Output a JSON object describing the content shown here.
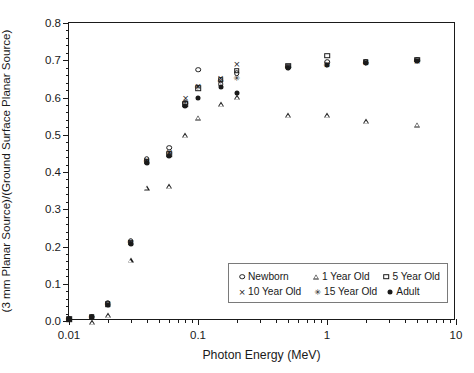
{
  "chart_data": {
    "type": "scatter",
    "title": "",
    "xlabel": "Photon Energy (MeV)",
    "ylabel": "(3 mm Planar Source)/(Ground Surface Planar Source)",
    "xscale": "log",
    "yscale": "linear",
    "xlim": [
      0.01,
      10
    ],
    "ylim": [
      0.0,
      0.8
    ],
    "ytick_labels": [
      "0.0",
      "0.1",
      "0.2",
      "0.3",
      "0.4",
      "0.5",
      "0.6",
      "0.7",
      "0.8"
    ],
    "ytick_values": [
      0.0,
      0.1,
      0.2,
      0.3,
      0.4,
      0.5,
      0.6,
      0.7,
      0.8
    ],
    "ytick_minor_step": 0.02,
    "xtick_labels": [
      "0.01",
      "0.1",
      "1",
      "10"
    ],
    "xtick_values": [
      0.01,
      0.1,
      1,
      10
    ],
    "grid": false,
    "legend_position": "lower right",
    "x": [
      0.01,
      0.015,
      0.02,
      0.03,
      0.04,
      0.06,
      0.08,
      0.1,
      0.15,
      0.2,
      0.5,
      1,
      2,
      5
    ],
    "series": [
      {
        "name": "Newborn",
        "marker": "circle-open",
        "values": [
          0.005,
          0.012,
          0.048,
          0.215,
          0.435,
          0.465,
          0.585,
          0.675,
          0.635,
          0.665,
          0.682,
          0.695,
          0.695,
          0.7
        ]
      },
      {
        "name": "1 Year Old",
        "marker": "triangle-open",
        "values": [
          0.005,
          0.01,
          0.042,
          0.205,
          0.412,
          0.43,
          0.58,
          0.64,
          0.69,
          0.722,
          0.688,
          0.7,
          0.697,
          0.702
        ]
      },
      {
        "name": "5 Year Old",
        "marker": "square-open",
        "values": [
          0.005,
          0.011,
          0.045,
          0.21,
          0.428,
          0.448,
          0.582,
          0.625,
          0.648,
          0.672,
          0.685,
          0.712,
          0.696,
          0.701
        ]
      },
      {
        "name": "10 Year Old",
        "marker": "cross",
        "values": [
          0.005,
          0.011,
          0.046,
          0.212,
          0.432,
          0.455,
          0.6,
          0.632,
          0.652,
          0.69,
          0.684,
          0.69,
          0.694,
          0.699
        ]
      },
      {
        "name": "15 Year Old",
        "marker": "star-x",
        "values": [
          0.005,
          0.011,
          0.045,
          0.211,
          0.43,
          0.45,
          0.588,
          0.628,
          0.645,
          0.652,
          0.683,
          0.688,
          0.693,
          0.698
        ]
      },
      {
        "name": "Adult",
        "marker": "circle-filled",
        "values": [
          0.005,
          0.01,
          0.044,
          0.208,
          0.425,
          0.442,
          0.578,
          0.6,
          0.628,
          0.612,
          0.68,
          0.686,
          0.692,
          0.697
        ]
      }
    ]
  },
  "legend": {
    "entries": [
      {
        "label": "Newborn",
        "marker": "circle-open"
      },
      {
        "label": "1 Year Old",
        "marker": "triangle-open"
      },
      {
        "label": "5 Year Old",
        "marker": "square-open"
      },
      {
        "label": "10 Year Old",
        "marker": "cross"
      },
      {
        "label": "15 Year Old",
        "marker": "star-x"
      },
      {
        "label": "Adult",
        "marker": "circle-filled"
      }
    ]
  },
  "colors": {
    "foreground": "#1a1a1a",
    "background": "#ffffff",
    "legend_border": "#7a7a7a"
  }
}
